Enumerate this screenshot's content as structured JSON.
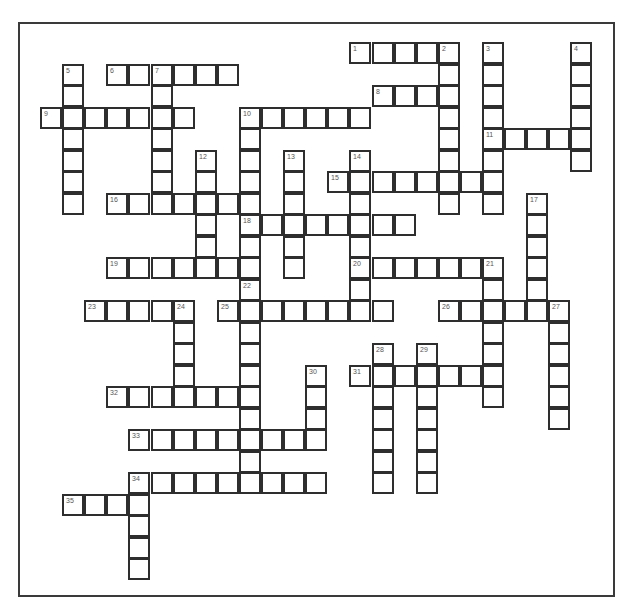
{
  "puzzle": {
    "grid": {
      "origin_x": 40,
      "origin_y": 42,
      "col_step": 22.1,
      "row_step": 21.5,
      "cell_size": 22
    },
    "words": [
      {
        "num": 1,
        "dir": "across",
        "row": 0,
        "col": 14,
        "len": 5
      },
      {
        "num": 2,
        "dir": "down",
        "row": 0,
        "col": 18,
        "len": 8
      },
      {
        "num": 3,
        "dir": "down",
        "row": 0,
        "col": 20,
        "len": 8
      },
      {
        "num": 4,
        "dir": "down",
        "row": 0,
        "col": 24,
        "len": 6
      },
      {
        "num": 5,
        "dir": "down",
        "row": 1,
        "col": 1,
        "len": 7
      },
      {
        "num": 6,
        "dir": "across",
        "row": 1,
        "col": 3,
        "len": 6
      },
      {
        "num": 7,
        "dir": "down",
        "row": 1,
        "col": 5,
        "len": 7
      },
      {
        "num": 8,
        "dir": "across",
        "row": 2,
        "col": 15,
        "len": 4
      },
      {
        "num": 9,
        "dir": "across",
        "row": 3,
        "col": 0,
        "len": 7
      },
      {
        "num": 10,
        "dir": "across",
        "row": 3,
        "col": 9,
        "len": 6
      },
      {
        "num": 10,
        "dir": "down",
        "row": 3,
        "col": 9,
        "len": 8
      },
      {
        "num": 11,
        "dir": "across",
        "row": 4,
        "col": 20,
        "len": 5
      },
      {
        "num": 12,
        "dir": "down",
        "row": 5,
        "col": 7,
        "len": 6
      },
      {
        "num": 13,
        "dir": "down",
        "row": 5,
        "col": 11,
        "len": 6
      },
      {
        "num": 14,
        "dir": "down",
        "row": 5,
        "col": 14,
        "len": 8
      },
      {
        "num": 15,
        "dir": "across",
        "row": 6,
        "col": 13,
        "len": 8
      },
      {
        "num": 16,
        "dir": "across",
        "row": 7,
        "col": 3,
        "len": 7
      },
      {
        "num": 17,
        "dir": "down",
        "row": 7,
        "col": 22,
        "len": 6
      },
      {
        "num": 18,
        "dir": "across",
        "row": 8,
        "col": 9,
        "len": 8
      },
      {
        "num": 19,
        "dir": "across",
        "row": 10,
        "col": 3,
        "len": 7
      },
      {
        "num": 20,
        "dir": "across",
        "row": 10,
        "col": 14,
        "len": 7
      },
      {
        "num": 21,
        "dir": "down",
        "row": 10,
        "col": 20,
        "len": 7
      },
      {
        "num": 22,
        "dir": "down",
        "row": 11,
        "col": 9,
        "len": 10
      },
      {
        "num": 23,
        "dir": "across",
        "row": 12,
        "col": 2,
        "len": 5
      },
      {
        "num": 24,
        "dir": "down",
        "row": 12,
        "col": 6,
        "len": 5
      },
      {
        "num": 25,
        "dir": "across",
        "row": 12,
        "col": 8,
        "len": 8
      },
      {
        "num": 26,
        "dir": "across",
        "row": 12,
        "col": 18,
        "len": 6
      },
      {
        "num": 27,
        "dir": "down",
        "row": 12,
        "col": 23,
        "len": 6
      },
      {
        "num": 28,
        "dir": "down",
        "row": 14,
        "col": 15,
        "len": 7
      },
      {
        "num": 29,
        "dir": "down",
        "row": 14,
        "col": 17,
        "len": 7
      },
      {
        "num": 30,
        "dir": "down",
        "row": 15,
        "col": 12,
        "len": 4
      },
      {
        "num": 31,
        "dir": "across",
        "row": 15,
        "col": 14,
        "len": 7
      },
      {
        "num": 32,
        "dir": "across",
        "row": 16,
        "col": 3,
        "len": 7
      },
      {
        "num": 33,
        "dir": "across",
        "row": 18,
        "col": 4,
        "len": 9
      },
      {
        "num": 34,
        "dir": "across",
        "row": 20,
        "col": 4,
        "len": 9
      },
      {
        "num": 34,
        "dir": "down",
        "row": 20,
        "col": 4,
        "len": 5
      },
      {
        "num": 35,
        "dir": "across",
        "row": 21,
        "col": 1,
        "len": 4
      }
    ]
  },
  "colors": {
    "line": "#2e2e2e",
    "number": "#555555",
    "background": "#ffffff"
  }
}
